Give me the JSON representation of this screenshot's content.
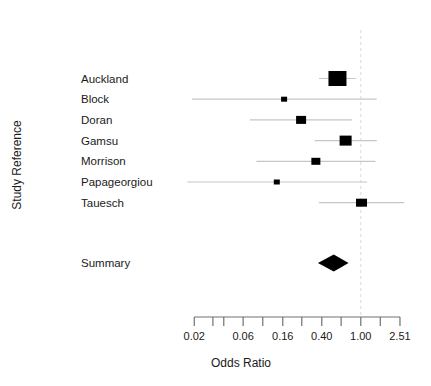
{
  "chart_data": {
    "type": "scatter",
    "subtype": "forest-plot",
    "title": "",
    "xlabel": "Odds Ratio",
    "ylabel": "Study Reference",
    "x_scale": "log",
    "axis_range": [
      0.02,
      2.51
    ],
    "reference_line": 1.0,
    "x_ticks": [
      {
        "value": 0.02,
        "label": "0.02"
      },
      {
        "value": 0.031,
        "label": ""
      },
      {
        "value": 0.04,
        "label": ""
      },
      {
        "value": 0.063,
        "label": "0.06"
      },
      {
        "value": 0.1,
        "label": ""
      },
      {
        "value": 0.16,
        "label": "0.16"
      },
      {
        "value": 0.25,
        "label": ""
      },
      {
        "value": 0.4,
        "label": "0.40"
      },
      {
        "value": 0.63,
        "label": ""
      },
      {
        "value": 1.0,
        "label": "1.00"
      },
      {
        "value": 1.58,
        "label": ""
      },
      {
        "value": 2.51,
        "label": "2.51"
      }
    ],
    "studies": [
      {
        "label": "Auckland",
        "or": 0.578,
        "ci_low": 0.375,
        "ci_high": 0.89,
        "box_w": 18,
        "box_h": 15
      },
      {
        "label": "Block",
        "or": 0.165,
        "ci_low": 0.019,
        "ci_high": 1.45,
        "box_w": 6,
        "box_h": 5
      },
      {
        "label": "Doran",
        "or": 0.246,
        "ci_low": 0.074,
        "ci_high": 0.813,
        "box_w": 10,
        "box_h": 8
      },
      {
        "label": "Gamsu",
        "or": 0.7,
        "ci_low": 0.338,
        "ci_high": 1.454,
        "box_w": 12,
        "box_h": 10
      },
      {
        "label": "Morrison",
        "or": 0.348,
        "ci_low": 0.086,
        "ci_high": 1.41,
        "box_w": 9,
        "box_h": 7
      },
      {
        "label": "Papageorgiou",
        "or": 0.139,
        "ci_low": 0.017,
        "ci_high": 1.16,
        "box_w": 6,
        "box_h": 5
      },
      {
        "label": "Tauesch",
        "or": 1.017,
        "ci_low": 0.373,
        "ci_high": 2.775,
        "box_w": 11,
        "box_h": 8
      }
    ],
    "summary": {
      "label": "Summary",
      "or": 0.53,
      "ci_low": 0.365,
      "ci_high": 0.75
    }
  },
  "colors": {
    "background": "#ffffff",
    "box": "#000000",
    "ci_line": "#c6c6c6",
    "reference_line": "#d9d9d9",
    "axis": "#707070",
    "text": "#1a1a1a"
  }
}
